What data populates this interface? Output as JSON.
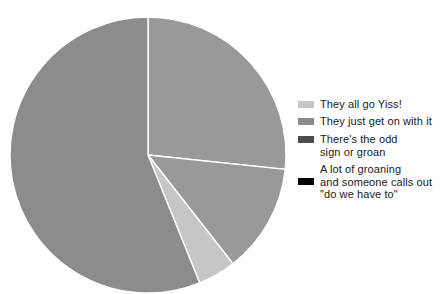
{
  "chart_data": {
    "type": "pie",
    "title": "",
    "labels": [
      "They all go Yiss!",
      "They just get on with it",
      "There's the odd\nsign or groan",
      "A lot of groaning\nand someone calls out\n\"do we have to\""
    ],
    "values": [
      4.4,
      56.1,
      26.7,
      12.8
    ],
    "colors": [
      "#c6c6c6",
      "#8c8c8c",
      "#4d4d4d",
      "#000000"
    ],
    "start_angle_deg": 0,
    "direction": "clockwise",
    "legend_position": "right",
    "grid": false,
    "slice_angles_deg": [
      {
        "label": "There's the odd sign or groan",
        "start": 0,
        "end": 96
      },
      {
        "label": "A lot of groaning and someone calls out \"do we have to\"",
        "start": 96,
        "end": 142
      },
      {
        "label": "They all go Yiss!",
        "start": 142,
        "end": 158
      },
      {
        "label": "They just get on with it",
        "start": 158,
        "end": 360
      }
    ]
  },
  "legend": {
    "items": [
      {
        "label": "They all go Yiss!",
        "color": "#c6c6c6"
      },
      {
        "label": "They just get on with it",
        "color": "#8c8c8c"
      },
      {
        "label": "There's the odd\nsign or groan",
        "color": "#4d4d4d"
      },
      {
        "label": "A lot of groaning\nand someone calls out\n\"do we have to\"",
        "color": "#000000"
      }
    ]
  },
  "pie": {
    "center_x": 148,
    "center_y": 155,
    "radius": 138,
    "separator_color": "#ffffff"
  }
}
